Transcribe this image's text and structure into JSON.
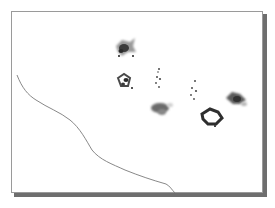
{
  "artwork": {
    "subject": "Ink wash painting of goldfish",
    "elements": [
      {
        "type": "goldfish",
        "label": "large-fish-top",
        "x": 124,
        "y": 48
      },
      {
        "type": "goldfish",
        "label": "small-fish-left",
        "x": 124,
        "y": 82
      },
      {
        "type": "fry-dots",
        "label": "fry-cluster-middle",
        "x": 158,
        "y": 80
      },
      {
        "type": "fry-dots",
        "label": "fry-cluster-right",
        "x": 193,
        "y": 90
      },
      {
        "type": "goldfish",
        "label": "fish-center",
        "x": 160,
        "y": 108
      },
      {
        "type": "goldfish",
        "label": "fish-right-lower",
        "x": 211,
        "y": 117
      },
      {
        "type": "goldfish",
        "label": "fish-far-right",
        "x": 235,
        "y": 98
      },
      {
        "type": "stroke",
        "label": "grass-stroke",
        "x": 17,
        "y": 75
      }
    ],
    "colors": {
      "ink_dark": "#2b2b2b",
      "ink_mid": "#6a6a6a",
      "ink_light": "#b5b5b5",
      "frame_border": "#9a9a9a",
      "shadow": "#6e6e6e",
      "paper": "#ffffff"
    }
  }
}
